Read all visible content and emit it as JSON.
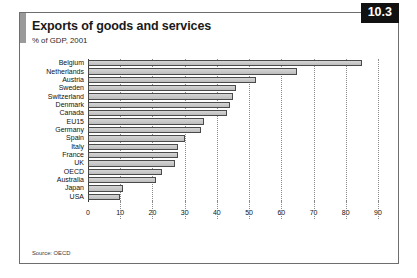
{
  "figure": {
    "badge": "10.3",
    "title": "Exports of goods and services",
    "subtitle": "% of GDP, 2001",
    "source": "Source: OECD"
  },
  "chart_data": {
    "type": "bar",
    "orientation": "horizontal",
    "title": "Exports of goods and services",
    "subtitle": "% of GDP, 2001",
    "xlabel": "",
    "ylabel": "",
    "xlim": [
      0,
      90
    ],
    "xticks": [
      0,
      10,
      20,
      30,
      40,
      50,
      60,
      70,
      80,
      90
    ],
    "grid": "vertical-dotted",
    "legend": "none",
    "bar_fill": "#c9c9c9",
    "bar_border": "#4a4a4a",
    "categories": [
      "Belgium",
      "Netherlands",
      "Austria",
      "Sweden",
      "Switzerland",
      "Denmark",
      "Canada",
      "EU15",
      "Germany",
      "Spain",
      "Italy",
      "France",
      "UK",
      "OECD",
      "Australia",
      "Japan",
      "USA"
    ],
    "values": [
      85,
      65,
      52,
      46,
      45,
      44,
      43,
      36,
      35,
      30,
      28,
      28,
      27,
      23,
      21,
      11,
      10
    ]
  }
}
